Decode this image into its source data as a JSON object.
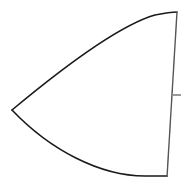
{
  "diagram": {
    "shape": "curved-wedge",
    "colors": {
      "background": "#ffffff",
      "curve_stroke": "#1a1a1a",
      "edge_stroke": "#555555"
    }
  }
}
